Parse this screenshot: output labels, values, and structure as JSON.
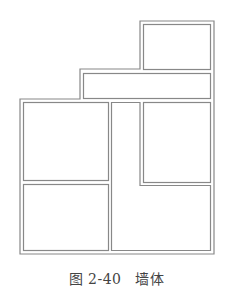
{
  "caption": {
    "figure_label": "图 2-40",
    "title": "墙体"
  },
  "diagram": {
    "type": "floor-plan-walls",
    "stroke_color": "#888888",
    "rooms": [
      "top-room",
      "band-room",
      "left-top-room",
      "left-bottom-room",
      "right-top-room",
      "l-shaped-room"
    ]
  }
}
